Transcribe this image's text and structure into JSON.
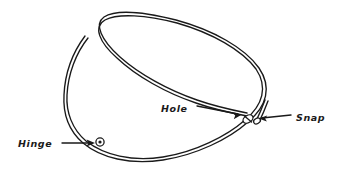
{
  "figure": {
    "background_color": "#ffffff",
    "ink_color": "#1a1a1a",
    "parts": [
      {
        "id": "hinge",
        "label": "Hinge",
        "icon": "hinge-pivot-icon",
        "label_x": 18,
        "label_y": 147,
        "arrow_from_x": 62,
        "arrow_from_y": 143,
        "arrow_to_x": 94,
        "arrow_to_y": 143,
        "marker_x": 100,
        "marker_y": 142,
        "arrow_direction": "right"
      },
      {
        "id": "hole",
        "label": "Hole",
        "icon": "hole-icon",
        "label_x": 161,
        "label_y": 112,
        "arrow_from_x": 197,
        "arrow_from_y": 107,
        "arrow_to_x": 242,
        "arrow_to_y": 116,
        "marker_x": 246,
        "marker_y": 120,
        "arrow_direction": "right"
      },
      {
        "id": "snap",
        "label": "Snap",
        "icon": "snap-clasp-icon",
        "label_x": 296,
        "label_y": 121,
        "arrow_from_x": 291,
        "arrow_from_y": 115,
        "arrow_to_x": 258,
        "arrow_to_y": 119,
        "marker_x": 254,
        "marker_y": 121,
        "arrow_direction": "left"
      }
    ],
    "ring": {
      "description": "double-line oval wire loop",
      "left_x": 63,
      "right_x": 272,
      "top_y": 12,
      "bottom_y": 161,
      "stroke_width": 1.4,
      "wire_gap": 2.6
    }
  }
}
